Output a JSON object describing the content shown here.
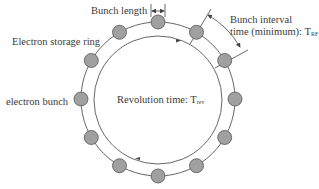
{
  "diagram": {
    "labels": {
      "bunch_length": "Bunch length",
      "storage_ring": "Electron storage ring",
      "electron_bunch": "electron bunch",
      "revolution_time": "Revolution time: T",
      "revolution_time_sub": "rev",
      "bunch_interval_line1": "Bunch interval",
      "bunch_interval_line2": "time (minimum): T",
      "bunch_interval_sub": "RF"
    },
    "ring": {
      "center_x": 158,
      "center_y": 99,
      "outer_radius": 77,
      "inner_radius": 64,
      "bunch_count": 12,
      "bunch_radius": 7
    },
    "colors": {
      "line": "#555555",
      "bunch_fill": "#a0a0a0",
      "bunch_stroke": "#555555",
      "text": "#3a3a3a"
    }
  }
}
